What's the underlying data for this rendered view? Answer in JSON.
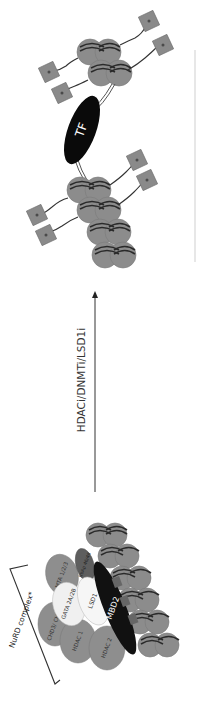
{
  "diagram": {
    "orientation": "rotated 90deg clockwise (text reads bottom-to-top)",
    "left_panel": {
      "bracket_label": "NuRD complex*",
      "subunits": [
        {
          "label": "MBD2",
          "color": "#111111",
          "text_color": "#ffffff"
        },
        {
          "label": "LSD1",
          "color": "#f4f4f4",
          "text_color": "#333333"
        },
        {
          "label": "GATA 2A/2B",
          "color": "#f0f0f0",
          "text_color": "#333333"
        },
        {
          "label": "MTA 1/2/3",
          "color": "#8e8e8e",
          "text_color": "#333333"
        },
        {
          "label": "CHD3/ CHD4",
          "color": "#8e8e8e",
          "text_color": "#333333"
        },
        {
          "label": "HDAC 1",
          "color": "#8e8e8e",
          "text_color": "#333333"
        },
        {
          "label": "HDAC 2",
          "color": "#8e8e8e",
          "text_color": "#333333"
        },
        {
          "label": "RbAp 46/48",
          "color": "#5e5e5e",
          "text_color": "#222222"
        }
      ],
      "state": "compacted chromatin, methylated DNA bound by MBD2"
    },
    "arrow": {
      "label": "HDACi/DNMTi/LSD1i",
      "direction": "up"
    },
    "right_panel": {
      "tf_label": "TF",
      "tf_color": "#0a0a0a",
      "state": "open chromatin with acetylated histone tails"
    },
    "colors": {
      "nucleosome": "#8c8c8c",
      "dna": "#2a2a2a",
      "histone_mark": "#8a8a8a",
      "background": "#ffffff"
    }
  }
}
